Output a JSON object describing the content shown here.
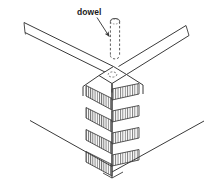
{
  "figure": {
    "type": "isometric-line-drawing",
    "background_color": "#ffffff",
    "line_color": "#3a3a3a",
    "hatch_color": "#555555",
    "dashed_color": "#4a4a4a",
    "width": 207,
    "height": 185
  },
  "annotations": {
    "dowel_label": "dowel"
  },
  "parts": {
    "dowel_pin": {
      "name": "dowel",
      "style": "dashed-cylinder-hidden-outline"
    },
    "dowel_hole": {
      "name": "dowel-hole",
      "style": "dashed-ellipse"
    },
    "top_rail_left": {
      "name": "left-top-rail"
    },
    "top_rail_right": {
      "name": "right-top-rail"
    },
    "corner_post": {
      "name": "corner-post",
      "joint_style": "hatched-finger-blocks",
      "block_count": 5
    },
    "lower_rail_left": {
      "name": "left-lower-rail"
    },
    "lower_rail_right": {
      "name": "right-lower-rail"
    }
  }
}
